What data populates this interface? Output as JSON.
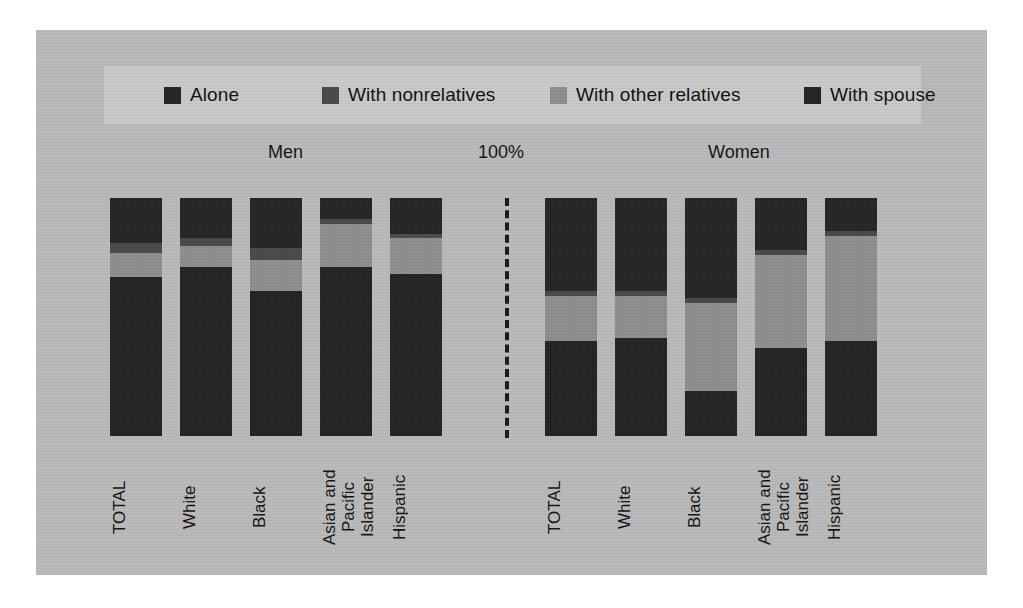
{
  "figure": {
    "background_color": "#b9b9b9",
    "legend_background_color": "#c9c9c9"
  },
  "legend": {
    "items": [
      {
        "label": "Alone",
        "color": "#262626",
        "icon": "square-swatch-icon"
      },
      {
        "label": "With nonrelatives",
        "color": "#4a4a4a",
        "icon": "square-swatch-icon"
      },
      {
        "label": "With other relatives",
        "color": "#8e8e8e",
        "icon": "square-swatch-icon"
      },
      {
        "label": "With spouse",
        "color": "#242424",
        "icon": "square-swatch-icon"
      }
    ]
  },
  "headers": {
    "men": "Men",
    "percent": "100%",
    "women": "Women"
  },
  "chart_data": {
    "type": "bar",
    "title": "",
    "subtitle": "",
    "xlabel": "",
    "ylabel": "",
    "ylim": [
      0,
      100
    ],
    "stacked": true,
    "stack_total": 100,
    "axis_annotation": "100%",
    "grid": false,
    "legend_position": "top",
    "panels": [
      {
        "name": "Men",
        "categories": [
          "TOTAL",
          "White",
          "Black",
          "Asian and\nPacific\nIslander",
          "Hispanic"
        ],
        "series": [
          {
            "name": "Alone",
            "color": "#262626",
            "values": [
              19,
              17,
              21,
              9,
              15
            ]
          },
          {
            "name": "With nonrelatives",
            "color": "#4a4a4a",
            "values": [
              4,
              3,
              5,
              2,
              2
            ]
          },
          {
            "name": "With other relatives",
            "color": "#8e8e8e",
            "values": [
              10,
              9,
              13,
              18,
              15
            ]
          },
          {
            "name": "With spouse",
            "color": "#242424",
            "values": [
              67,
              71,
              61,
              71,
              68
            ]
          }
        ]
      },
      {
        "name": "Women",
        "categories": [
          "TOTAL",
          "White",
          "Black",
          "Asian and\nPacific\nIslander",
          "Hispanic"
        ],
        "series": [
          {
            "name": "Alone",
            "color": "#262626",
            "values": [
              39,
              39,
              42,
              22,
              14
            ]
          },
          {
            "name": "With nonrelatives",
            "color": "#4a4a4a",
            "values": [
              2,
              2,
              2,
              2,
              2
            ]
          },
          {
            "name": "With other relatives",
            "color": "#8e8e8e",
            "values": [
              19,
              18,
              37,
              39,
              44
            ]
          },
          {
            "name": "With spouse",
            "color": "#242424",
            "values": [
              40,
              41,
              19,
              37,
              40
            ]
          }
        ]
      }
    ]
  }
}
